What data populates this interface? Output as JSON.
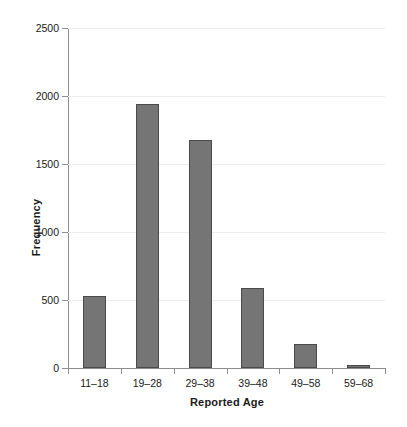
{
  "chart_data": {
    "type": "bar",
    "title": "",
    "xlabel": "Reported Age",
    "ylabel": "Frequency",
    "categories": [
      "11–18",
      "19–28",
      "29–38",
      "39–48",
      "49–58",
      "59–68"
    ],
    "values": [
      530,
      1940,
      1680,
      585,
      180,
      25
    ],
    "ylim": [
      0,
      2500
    ],
    "yticks": [
      0,
      500,
      1000,
      1500,
      2000,
      2500
    ],
    "ytick_labels": [
      "0",
      "500",
      "1000",
      "1500",
      "2000",
      "2500"
    ],
    "grid": "horizontal",
    "legend": "none",
    "bar_color": "#757575",
    "bar_edge_color": "#4a4a4a",
    "grid_color": "#ececed",
    "axis_color": "#8d8d8d",
    "background": "#ffffff"
  }
}
